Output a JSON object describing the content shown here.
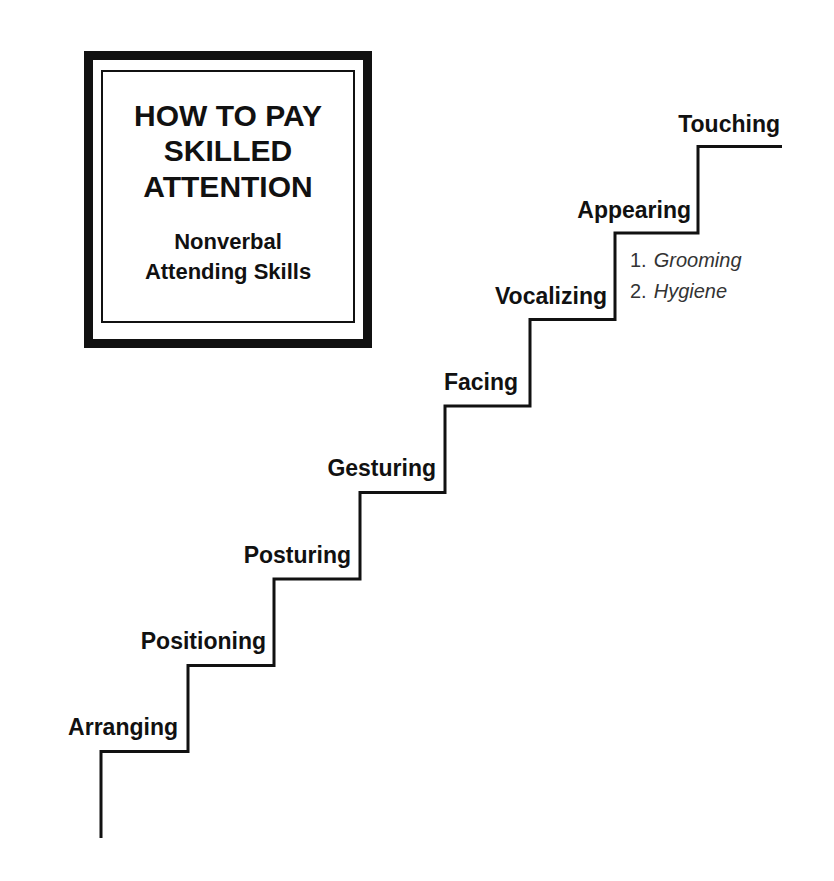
{
  "title_box": {
    "title_lines": [
      "HOW TO PAY",
      "SKILLED",
      "ATTENTION"
    ],
    "subtitle_lines": [
      "Nonverbal",
      "Attending Skills"
    ]
  },
  "staircase": {
    "line_color": "#111111",
    "steps": [
      {
        "label": "Arranging"
      },
      {
        "label": "Positioning"
      },
      {
        "label": "Posturing"
      },
      {
        "label": "Gesturing"
      },
      {
        "label": "Facing"
      },
      {
        "label": "Vocalizing"
      },
      {
        "label": "Appearing"
      },
      {
        "label": "Touching"
      }
    ],
    "appearing_subitems": [
      {
        "number": "1.",
        "text": "Grooming"
      },
      {
        "number": "2.",
        "text": "Hygiene"
      }
    ]
  }
}
